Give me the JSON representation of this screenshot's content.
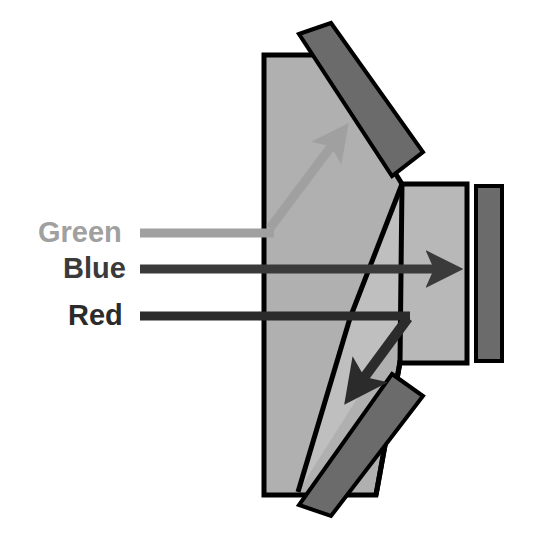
{
  "figure": {
    "kind": "optical-diagram",
    "background_color": "#ffffff",
    "glass_fill": "#b0b0b0",
    "glass_fill_light": "#bdbdbd",
    "outline_color": "#000000",
    "detector_fill": "#666666"
  },
  "labels": {
    "green": {
      "text": "Green",
      "color": "#a0a0a0",
      "x": 38,
      "y": 234
    },
    "blue": {
      "text": "Blue",
      "color": "#3a3a3a",
      "x": 63,
      "y": 270
    },
    "red": {
      "text": "Red",
      "color": "#2b2b2b",
      "x": 68,
      "y": 317
    }
  },
  "rays": [
    {
      "name": "green-ray",
      "label": "Green",
      "color": "#a0a0a0",
      "stroke_width": 9,
      "entry_y": 233,
      "path": "M 140,233 L 268,233 L 268,222 L 344,130",
      "arrow_tip_x": 348,
      "arrow_tip_y": 125,
      "direction": "reflected-up-to-top-mirror"
    },
    {
      "name": "blue-ray",
      "label": "Blue",
      "color": "#3a3a3a",
      "stroke_width": 9,
      "entry_y": 269,
      "path": "M 140,269 L 445,269",
      "arrow_tip_x": 473,
      "arrow_tip_y": 269,
      "direction": "straight-through-to-right-detector"
    },
    {
      "name": "red-ray",
      "label": "Red",
      "color": "#2b2b2b",
      "stroke_width": 9,
      "entry_y": 316,
      "path": "M 140,316 L 408,316 L 350,396",
      "arrow_tip_x": 344,
      "arrow_tip_y": 406,
      "direction": "reflected-down-to-bottom-mirror"
    }
  ],
  "components": {
    "main_prism": {
      "name": "main-prism",
      "points": "264,55 264,495 376,495 408,318 402,184",
      "fill": "#b0b0b0"
    },
    "main_prism_upper_facet": {
      "name": "main-prism-upper-facet",
      "points": "264,55 322,55 402,184",
      "fill": "#b0b0b0"
    },
    "main_prism_inner_wedge": {
      "name": "main-prism-inner-wedge",
      "points": "402,184 408,318 295,490 348,324",
      "fill": "#bdbdbd"
    },
    "right_prism": {
      "name": "right-prism",
      "points": "401,184 467,184 467,363 400,363",
      "fill": "#b0b0b0"
    },
    "top_mirror": {
      "name": "top-mirror-detector",
      "points": "300,33 332,26 420,152 391,175",
      "fill": "#666666",
      "rotation_deg": 55
    },
    "bottom_mirror": {
      "name": "bottom-mirror-detector",
      "points": "392,375 420,392 332,513 300,504",
      "fill": "#666666",
      "rotation_deg": -55
    },
    "right_detector": {
      "name": "right-detector",
      "points": "476,186 502,186 502,361 476,361",
      "fill": "#666666"
    }
  },
  "geometry_notes": {
    "prism_apex_x": 402,
    "prism_apex_y": 184,
    "prism_lower_vertex_x": 408,
    "prism_lower_vertex_y": 318
  }
}
